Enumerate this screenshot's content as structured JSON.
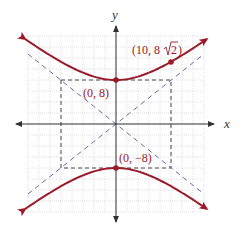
{
  "chart_data": {
    "type": "line",
    "title": "",
    "xlabel": "x",
    "ylabel": "y",
    "equation": "y^2/64 - x^2/100 = 1",
    "grid": true,
    "grid_step": 2,
    "xlim": [
      -16,
      16
    ],
    "ylim": [
      -16,
      16
    ],
    "series": [
      {
        "name": "upper branch",
        "type": "hyperbola",
        "a": 10,
        "b": 8,
        "color": "#9b1b2a"
      },
      {
        "name": "lower branch",
        "type": "hyperbola",
        "a": 10,
        "b": 8,
        "color": "#9b1b2a"
      },
      {
        "name": "asymptote y = 4x/5",
        "type": "dashed-line",
        "slope": 0.8,
        "color": "#6a6aa8"
      },
      {
        "name": "asymptote y = -4x/5",
        "type": "dashed-line",
        "slope": -0.8,
        "color": "#6a6aa8"
      },
      {
        "name": "central rectangle",
        "type": "dashed-rect",
        "x": [
          -10,
          10
        ],
        "y": [
          -8,
          8
        ],
        "color": "#333333"
      }
    ],
    "points": [
      {
        "x": 0,
        "y": 8,
        "label": "(0, 8)"
      },
      {
        "x": 0,
        "y": -8,
        "label": "(0, −8)"
      },
      {
        "x": 10,
        "y": 11.31,
        "label": "(10, 8√2)"
      }
    ]
  },
  "labels": {
    "x_axis": "x",
    "y_axis": "y",
    "vertex_top": "(0, 8)",
    "vertex_bottom": "(0, −8)",
    "point_pre": "(10, 8",
    "point_rad": "2",
    "point_post": ")"
  },
  "colors": {
    "curve": "#9b1b2a",
    "asymptote": "#6a6aa8",
    "grid": "#cfcfcf",
    "axis": "#333333",
    "label": "#9b1b2a"
  }
}
